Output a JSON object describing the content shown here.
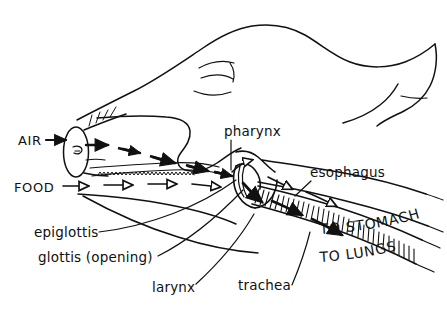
{
  "figure": {
    "background_color": "#ffffff",
    "ink_color": "#111111",
    "width": 447,
    "height": 311
  },
  "labels": {
    "air": "AIR",
    "food": "FOOD",
    "pharynx": "pharynx",
    "esophagus": "esophagus",
    "epiglottis": "epiglottis",
    "glottis": "glottis (opening)",
    "larynx": "larynx",
    "trachea": "trachea",
    "to_stomach": "TO STOMACH",
    "to_lungs": "TO LUNGS"
  },
  "pathways": [
    {
      "name": "air",
      "entry_label": "AIR",
      "arrow_style": "solid-filled",
      "destination": "TO LUNGS",
      "route": [
        "nostril",
        "nasal cavity",
        "pharynx",
        "glottis",
        "larynx",
        "trachea"
      ]
    },
    {
      "name": "food",
      "entry_label": "FOOD",
      "arrow_style": "hollow-open",
      "destination": "TO STOMACH",
      "route": [
        "mouth",
        "oral cavity",
        "pharynx",
        "esophagus"
      ]
    }
  ],
  "annotations": [
    {
      "key": "pharynx",
      "text": "pharynx",
      "x": 225,
      "y": 135,
      "anchor": "start"
    },
    {
      "key": "esophagus",
      "text": "esophagus",
      "x": 310,
      "y": 177,
      "anchor": "start"
    },
    {
      "key": "epiglottis",
      "text": "epiglottis",
      "x": 35,
      "y": 237,
      "anchor": "start"
    },
    {
      "key": "glottis",
      "text": "glottis (opening)",
      "x": 40,
      "y": 262,
      "anchor": "start"
    },
    {
      "key": "larynx",
      "text": "larynx",
      "x": 155,
      "y": 293,
      "anchor": "start"
    },
    {
      "key": "trachea",
      "text": "trachea",
      "x": 240,
      "y": 291,
      "anchor": "start"
    },
    {
      "key": "air",
      "text": "AIR",
      "x": 18,
      "y": 141,
      "anchor": "start"
    },
    {
      "key": "food",
      "text": "FOOD",
      "x": 16,
      "y": 188,
      "anchor": "start"
    },
    {
      "key": "to_stomach",
      "text": "TO STOMACH",
      "x": 0,
      "y": 0,
      "anchor": "start"
    },
    {
      "key": "to_lungs",
      "text": "TO LUNGS",
      "x": 0,
      "y": 0,
      "anchor": "start"
    }
  ]
}
